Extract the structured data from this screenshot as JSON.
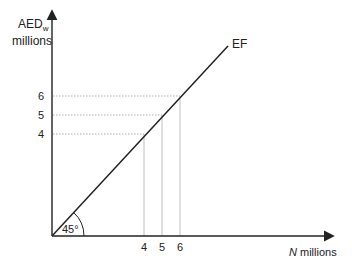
{
  "diagram": {
    "y_axis_label": "AED",
    "y_axis_subscript": "w",
    "y_axis_unit": "millions",
    "x_axis_var": "N",
    "x_axis_unit": " millions",
    "line_label": "EF",
    "angle_label": "45°",
    "y_ticks": [
      "6",
      "5",
      "4"
    ],
    "x_ticks": [
      "4",
      "5",
      "6"
    ],
    "colors": {
      "line": "#222222",
      "guide": "#9a9a9a",
      "axis": "#222222"
    }
  }
}
